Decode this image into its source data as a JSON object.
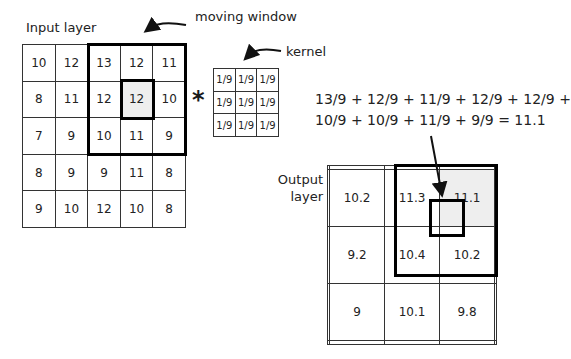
{
  "labels": {
    "input_layer": "Input layer",
    "moving_window": "moving window",
    "kernel": "kernel",
    "output_layer_line1": "Output",
    "output_layer_line2": "layer",
    "operator": "*"
  },
  "formula": {
    "line1": "13/9 + 12/9 + 11/9 + 12/9 + 12/9 +",
    "line2": "10/9 + 10/9 + 11/9 + 9/9 = 11.1"
  },
  "input_grid": [
    [
      "10",
      "12",
      "13",
      "12",
      "11"
    ],
    [
      "8",
      "11",
      "12",
      "12",
      "10"
    ],
    [
      "7",
      "9",
      "10",
      "11",
      "9"
    ],
    [
      "8",
      "9",
      "9",
      "11",
      "8"
    ],
    [
      "9",
      "10",
      "12",
      "10",
      "8"
    ]
  ],
  "kernel_grid": [
    [
      "1/9",
      "1/9",
      "1/9"
    ],
    [
      "1/9",
      "1/9",
      "1/9"
    ],
    [
      "1/9",
      "1/9",
      "1/9"
    ]
  ],
  "output_grid": [
    [
      "",
      "",
      "",
      "",
      ""
    ],
    [
      "",
      "10.2",
      "11.3",
      "11.1",
      ""
    ],
    [
      "",
      "9.2",
      "10.4",
      "10.2",
      ""
    ],
    [
      "",
      "9",
      "10.1",
      "9.8",
      ""
    ],
    [
      "",
      "",
      "",
      "",
      ""
    ]
  ],
  "highlight": {
    "input_cell": [
      1,
      3
    ],
    "output_cell": [
      1,
      3
    ],
    "highlight_color": "#eeeeee"
  }
}
